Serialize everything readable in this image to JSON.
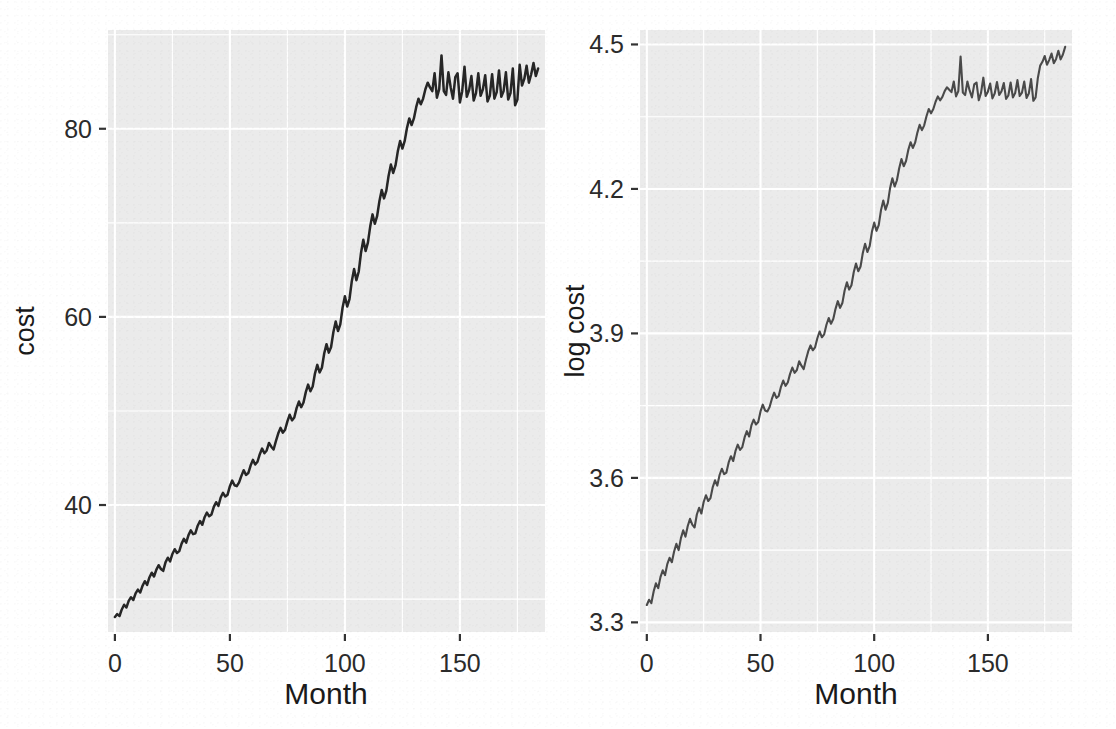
{
  "figure": {
    "title": "",
    "background_color": "#FFFFFF",
    "panel_color": "#EBEBEB",
    "gridline_color": "#FFFFFF",
    "line_color": "#262626",
    "layout": "two side-by-side panels"
  },
  "panels": [
    {
      "id": "cost",
      "ylabel": "cost",
      "xlabel": "Month",
      "y_ticks": [
        "40",
        "60",
        "80"
      ],
      "x_ticks": [
        "0",
        "50",
        "100",
        "150"
      ]
    },
    {
      "id": "log-cost",
      "ylabel": "log cost",
      "xlabel": "Month",
      "y_ticks": [
        "3.3",
        "3.6",
        "3.9",
        "4.2",
        "4.5"
      ],
      "x_ticks": [
        "0",
        "50",
        "100",
        "150"
      ]
    }
  ],
  "chart_data": [
    {
      "type": "line",
      "title": "",
      "xlabel": "Month",
      "ylabel": "cost",
      "xlim": [
        -3,
        187
      ],
      "ylim": [
        26.5,
        90.5
      ],
      "grid": true,
      "legend": "none",
      "x_ticks": [
        0,
        50,
        100,
        150
      ],
      "y_ticks": [
        40,
        60,
        80
      ],
      "x_minor_ticks": [
        25,
        75,
        125,
        175
      ],
      "y_minor_ticks": [
        30,
        50,
        70,
        90
      ],
      "x": [
        0,
        1,
        2,
        3,
        4,
        5,
        6,
        7,
        8,
        9,
        10,
        11,
        12,
        13,
        14,
        15,
        16,
        17,
        18,
        19,
        20,
        21,
        22,
        23,
        24,
        25,
        26,
        27,
        28,
        29,
        30,
        31,
        32,
        33,
        34,
        35,
        36,
        37,
        38,
        39,
        40,
        41,
        42,
        43,
        44,
        45,
        46,
        47,
        48,
        49,
        50,
        51,
        52,
        53,
        54,
        55,
        56,
        57,
        58,
        59,
        60,
        61,
        62,
        63,
        64,
        65,
        66,
        67,
        68,
        69,
        70,
        71,
        72,
        73,
        74,
        75,
        76,
        77,
        78,
        79,
        80,
        81,
        82,
        83,
        84,
        85,
        86,
        87,
        88,
        89,
        90,
        91,
        92,
        93,
        94,
        95,
        96,
        97,
        98,
        99,
        100,
        101,
        102,
        103,
        104,
        105,
        106,
        107,
        108,
        109,
        110,
        111,
        112,
        113,
        114,
        115,
        116,
        117,
        118,
        119,
        120,
        121,
        122,
        123,
        124,
        125,
        126,
        127,
        128,
        129,
        130,
        131,
        132,
        133,
        134,
        135,
        136,
        137,
        138,
        139,
        140,
        141,
        142,
        143,
        144,
        145,
        146,
        147,
        148,
        149,
        150,
        151,
        152,
        153,
        154,
        155,
        156,
        157,
        158,
        159,
        160,
        161,
        162,
        163,
        164,
        165,
        166,
        167,
        168,
        169,
        170,
        171,
        172,
        173,
        174,
        175,
        176,
        177,
        178,
        179,
        180,
        181,
        182,
        183,
        184
      ],
      "values": [
        28.1,
        28.4,
        28.2,
        28.9,
        29.4,
        29.1,
        29.8,
        30.2,
        29.9,
        30.6,
        31.0,
        30.7,
        31.4,
        31.9,
        31.5,
        32.3,
        32.8,
        32.4,
        33.1,
        33.6,
        33.2,
        33.0,
        33.9,
        34.4,
        34.0,
        34.8,
        35.3,
        34.9,
        35.1,
        35.9,
        36.4,
        36.0,
        36.8,
        37.3,
        36.9,
        37.0,
        37.8,
        38.3,
        37.9,
        38.7,
        39.2,
        38.8,
        39.0,
        39.8,
        40.3,
        39.9,
        40.8,
        41.3,
        40.9,
        41.1,
        42.0,
        42.6,
        42.1,
        42.0,
        42.4,
        43.1,
        43.7,
        43.2,
        43.4,
        44.2,
        44.8,
        44.3,
        44.6,
        45.4,
        46.0,
        45.5,
        45.8,
        46.6,
        46.2,
        45.9,
        46.8,
        47.6,
        48.2,
        47.7,
        48.0,
        48.9,
        49.6,
        49.0,
        49.3,
        50.3,
        51.0,
        50.4,
        50.9,
        52.0,
        52.8,
        52.1,
        52.6,
        54.0,
        54.9,
        54.1,
        54.6,
        56.1,
        57.1,
        56.2,
        56.8,
        58.4,
        59.5,
        58.5,
        59.2,
        61.0,
        62.2,
        61.1,
        61.9,
        63.8,
        65.1,
        63.9,
        64.8,
        66.8,
        68.2,
        67.0,
        67.9,
        69.6,
        70.9,
        69.9,
        70.7,
        72.3,
        73.5,
        72.6,
        73.4,
        75.0,
        76.2,
        75.3,
        76.1,
        77.6,
        78.7,
        77.9,
        78.7,
        80.1,
        81.1,
        80.4,
        81.1,
        82.3,
        83.2,
        82.6,
        83.2,
        84.2,
        84.9,
        84.4,
        84.0,
        85.9,
        83.3,
        84.2,
        87.8,
        84.0,
        83.6,
        86.0,
        84.4,
        83.2,
        85.5,
        85.9,
        82.8,
        84.0,
        86.6,
        83.4,
        84.1,
        85.6,
        83.0,
        83.8,
        85.9,
        83.5,
        84.2,
        85.7,
        82.9,
        83.5,
        85.8,
        83.2,
        83.9,
        86.2,
        83.4,
        84.0,
        86.0,
        83.1,
        83.8,
        86.4,
        82.5,
        83.1,
        86.8,
        84.6,
        85.3,
        86.7,
        84.9,
        85.8,
        87.0,
        85.6,
        86.4,
        88.0,
        86.2,
        87.1,
        88.6
      ]
    },
    {
      "type": "line",
      "title": "",
      "xlabel": "Month",
      "ylabel": "log cost",
      "xlim": [
        -3,
        187
      ],
      "ylim": [
        3.28,
        4.53
      ],
      "grid": true,
      "legend": "none",
      "x_ticks": [
        0,
        50,
        100,
        150
      ],
      "y_ticks": [
        3.3,
        3.6,
        3.9,
        4.2,
        4.5
      ],
      "x_minor_ticks": [
        25,
        75,
        125,
        175
      ],
      "y_minor_ticks": [
        3.45,
        3.75,
        4.05,
        4.35
      ],
      "x": [
        0,
        1,
        2,
        3,
        4,
        5,
        6,
        7,
        8,
        9,
        10,
        11,
        12,
        13,
        14,
        15,
        16,
        17,
        18,
        19,
        20,
        21,
        22,
        23,
        24,
        25,
        26,
        27,
        28,
        29,
        30,
        31,
        32,
        33,
        34,
        35,
        36,
        37,
        38,
        39,
        40,
        41,
        42,
        43,
        44,
        45,
        46,
        47,
        48,
        49,
        50,
        51,
        52,
        53,
        54,
        55,
        56,
        57,
        58,
        59,
        60,
        61,
        62,
        63,
        64,
        65,
        66,
        67,
        68,
        69,
        70,
        71,
        72,
        73,
        74,
        75,
        76,
        77,
        78,
        79,
        80,
        81,
        82,
        83,
        84,
        85,
        86,
        87,
        88,
        89,
        90,
        91,
        92,
        93,
        94,
        95,
        96,
        97,
        98,
        99,
        100,
        101,
        102,
        103,
        104,
        105,
        106,
        107,
        108,
        109,
        110,
        111,
        112,
        113,
        114,
        115,
        116,
        117,
        118,
        119,
        120,
        121,
        122,
        123,
        124,
        125,
        126,
        127,
        128,
        129,
        130,
        131,
        132,
        133,
        134,
        135,
        136,
        137,
        138,
        139,
        140,
        141,
        142,
        143,
        144,
        145,
        146,
        147,
        148,
        149,
        150,
        151,
        152,
        153,
        154,
        155,
        156,
        157,
        158,
        159,
        160,
        161,
        162,
        163,
        164,
        165,
        166,
        167,
        168,
        169,
        170,
        171,
        172,
        173,
        174,
        175,
        176,
        177,
        178,
        179,
        180,
        181,
        182,
        183,
        184
      ],
      "values": [
        3.336,
        3.347,
        3.34,
        3.364,
        3.381,
        3.371,
        3.394,
        3.408,
        3.398,
        3.421,
        3.434,
        3.425,
        3.447,
        3.463,
        3.45,
        3.475,
        3.491,
        3.478,
        3.5,
        3.515,
        3.503,
        3.497,
        3.524,
        3.538,
        3.526,
        3.55,
        3.564,
        3.552,
        3.558,
        3.581,
        3.595,
        3.584,
        3.606,
        3.619,
        3.608,
        3.611,
        3.632,
        3.645,
        3.635,
        3.656,
        3.669,
        3.658,
        3.664,
        3.684,
        3.697,
        3.686,
        3.709,
        3.721,
        3.711,
        3.716,
        3.738,
        3.752,
        3.74,
        3.738,
        3.747,
        3.764,
        3.777,
        3.766,
        3.77,
        3.789,
        3.802,
        3.791,
        3.798,
        3.816,
        3.829,
        3.818,
        3.824,
        3.842,
        3.833,
        3.826,
        3.846,
        3.863,
        3.875,
        3.865,
        3.871,
        3.89,
        3.904,
        3.892,
        3.898,
        3.918,
        3.932,
        3.92,
        3.93,
        3.951,
        3.967,
        3.953,
        3.963,
        3.989,
        4.006,
        3.991,
        4.0,
        4.027,
        4.045,
        4.029,
        4.039,
        4.067,
        4.086,
        4.069,
        4.081,
        4.111,
        4.13,
        4.113,
        4.125,
        4.156,
        4.176,
        4.157,
        4.171,
        4.202,
        4.222,
        4.205,
        4.218,
        4.243,
        4.262,
        4.247,
        4.258,
        4.281,
        4.297,
        4.285,
        4.296,
        4.317,
        4.333,
        4.322,
        4.332,
        4.351,
        4.366,
        4.357,
        4.366,
        4.381,
        4.392,
        4.384,
        4.391,
        4.403,
        4.411,
        4.406,
        4.401,
        4.423,
        4.392,
        4.403,
        4.475,
        4.4,
        4.395,
        4.423,
        4.404,
        4.39,
        4.417,
        4.421,
        4.384,
        4.4,
        4.431,
        4.393,
        4.402,
        4.419,
        4.388,
        4.398,
        4.422,
        4.395,
        4.403,
        4.42,
        4.387,
        4.394,
        4.421,
        4.39,
        4.399,
        4.426,
        4.393,
        4.4,
        4.423,
        4.389,
        4.398,
        4.428,
        4.383,
        4.39,
        4.431,
        4.456,
        4.464,
        4.476,
        4.458,
        4.468,
        4.481,
        4.461,
        4.47,
        4.487,
        4.469,
        4.479,
        4.495
      ]
    }
  ]
}
